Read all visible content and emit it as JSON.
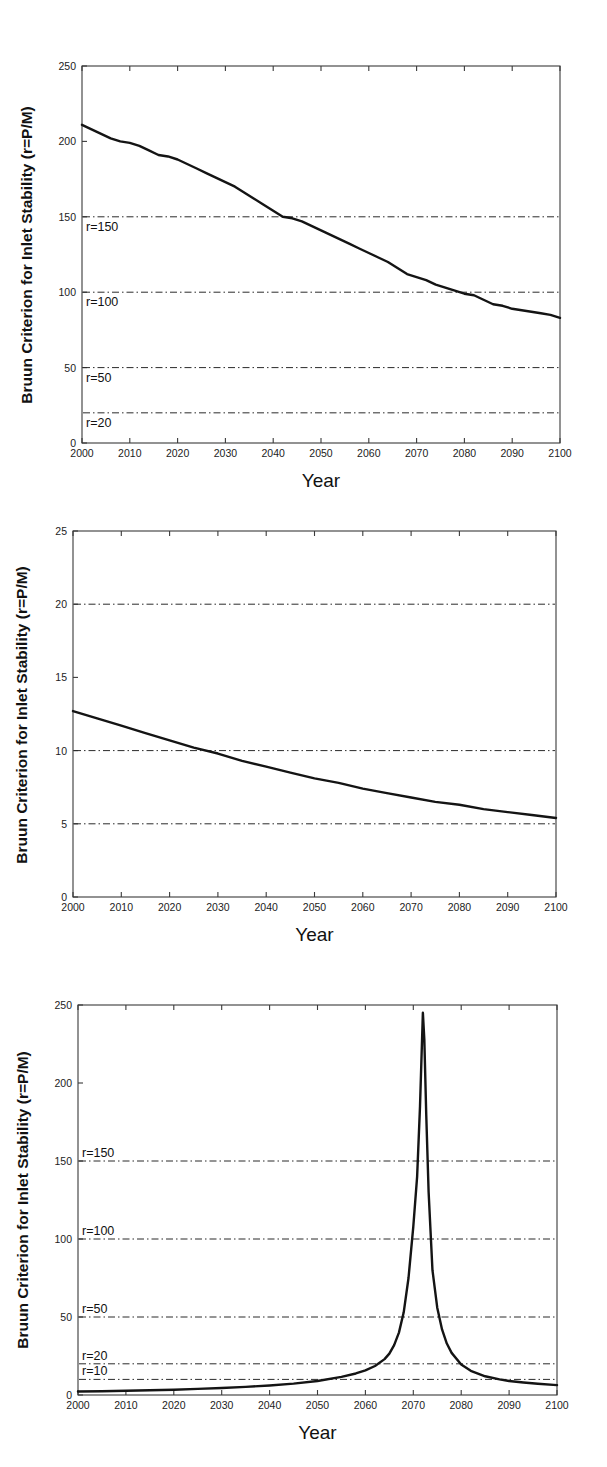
{
  "document": {
    "kind": "three-panel-figure",
    "panel_count": 3
  },
  "shared": {
    "ylabel": "Bruun Criterion for Inlet Stability (r=P/M)",
    "xlabel": "Year",
    "xticks": [
      "2000",
      "2010",
      "2020",
      "2030",
      "2040",
      "2050",
      "2060",
      "2070",
      "2080",
      "2090",
      "2100"
    ]
  },
  "chart_data": [
    {
      "id": "panel-a",
      "type": "line",
      "title": "",
      "xlabel": "Year",
      "ylabel": "Bruun Criterion for Inlet Stability (r=P/M)",
      "xlim": [
        2000,
        2100
      ],
      "ylim": [
        0,
        250
      ],
      "xticks": [
        2000,
        2010,
        2020,
        2030,
        2040,
        2050,
        2060,
        2070,
        2080,
        2090,
        2100
      ],
      "yticks": [
        0,
        50,
        100,
        150,
        200,
        250
      ],
      "xticklabels": [
        "2000",
        "2010",
        "2020",
        "2030",
        "2040",
        "2050",
        "2060",
        "2070",
        "2080",
        "2090",
        "2100"
      ],
      "yticklabels": [
        "0",
        "50",
        "100",
        "150",
        "200",
        "250"
      ],
      "grid": false,
      "legend": "none",
      "reference_lines": [
        {
          "value": 150,
          "label": "r=150",
          "label_side": "below"
        },
        {
          "value": 100,
          "label": "r=100",
          "label_side": "below"
        },
        {
          "value": 50,
          "label": "r=50",
          "label_side": "below"
        },
        {
          "value": 20,
          "label": "r=20",
          "label_side": "below"
        }
      ],
      "x": [
        2000,
        2002,
        2004,
        2006,
        2008,
        2010,
        2012,
        2014,
        2016,
        2018,
        2020,
        2022,
        2024,
        2026,
        2028,
        2030,
        2032,
        2034,
        2036,
        2038,
        2040,
        2042,
        2044,
        2046,
        2048,
        2050,
        2052,
        2054,
        2056,
        2058,
        2060,
        2062,
        2064,
        2066,
        2068,
        2070,
        2072,
        2074,
        2076,
        2078,
        2080,
        2082,
        2084,
        2086,
        2088,
        2090,
        2092,
        2094,
        2096,
        2098,
        2100
      ],
      "series": [
        {
          "name": "r (P/M)",
          "values": [
            211,
            208,
            205,
            202,
            200,
            199,
            197,
            194,
            191,
            190,
            188,
            185,
            182,
            179,
            176,
            173,
            170,
            166,
            162,
            158,
            154,
            150,
            149,
            147,
            144,
            141,
            138,
            135,
            132,
            129,
            126,
            123,
            120,
            116,
            112,
            110,
            108,
            105,
            103,
            101,
            99,
            98,
            95,
            92,
            91,
            89,
            88,
            87,
            86,
            85,
            83
          ]
        }
      ]
    },
    {
      "id": "panel-b",
      "type": "line",
      "title": "",
      "xlabel": "Year",
      "ylabel": "Bruun Criterion for Inlet Stability (r=P/M)",
      "xlim": [
        2000,
        2100
      ],
      "ylim": [
        0,
        25
      ],
      "xticks": [
        2000,
        2010,
        2020,
        2030,
        2040,
        2050,
        2060,
        2070,
        2080,
        2090,
        2100
      ],
      "yticks": [
        0,
        5,
        10,
        15,
        20,
        25
      ],
      "xticklabels": [
        "2000",
        "2010",
        "2020",
        "2030",
        "2040",
        "2050",
        "2060",
        "2070",
        "2080",
        "2090",
        "2100"
      ],
      "yticklabels": [
        "0",
        "5",
        "10",
        "15",
        "20",
        "25"
      ],
      "grid": false,
      "legend": "none",
      "reference_lines": [
        {
          "value": 20,
          "label": "",
          "label_side": "none"
        },
        {
          "value": 10,
          "label": "",
          "label_side": "none"
        },
        {
          "value": 5,
          "label": "",
          "label_side": "none"
        }
      ],
      "x": [
        2000,
        2005,
        2010,
        2015,
        2020,
        2025,
        2030,
        2035,
        2040,
        2045,
        2050,
        2055,
        2060,
        2065,
        2070,
        2075,
        2080,
        2085,
        2090,
        2095,
        2100
      ],
      "series": [
        {
          "name": "r (P/M)",
          "values": [
            12.7,
            12.2,
            11.7,
            11.2,
            10.7,
            10.2,
            9.8,
            9.3,
            8.9,
            8.5,
            8.1,
            7.8,
            7.4,
            7.1,
            6.8,
            6.5,
            6.3,
            6.0,
            5.8,
            5.6,
            5.4
          ]
        }
      ]
    },
    {
      "id": "panel-c",
      "type": "line",
      "title": "",
      "xlabel": "Year",
      "ylabel": "Bruun Criterion for Inlet Stability (r=P/M)",
      "xlim": [
        2000,
        2100
      ],
      "ylim": [
        0,
        250
      ],
      "xticks": [
        2000,
        2010,
        2020,
        2030,
        2040,
        2050,
        2060,
        2070,
        2080,
        2090,
        2100
      ],
      "yticks": [
        0,
        50,
        100,
        150,
        200,
        250
      ],
      "xticklabels": [
        "2000",
        "2010",
        "2020",
        "2030",
        "2040",
        "2050",
        "2060",
        "2070",
        "2080",
        "2090",
        "2100"
      ],
      "yticklabels": [
        "0",
        "50",
        "100",
        "150",
        "200",
        "250"
      ],
      "grid": false,
      "legend": "none",
      "annotation": "Singular peak near 2072 reaching approximately 245",
      "reference_lines": [
        {
          "value": 150,
          "label": "r=150",
          "label_side": "above"
        },
        {
          "value": 100,
          "label": "r=100",
          "label_side": "above"
        },
        {
          "value": 50,
          "label": "r=50",
          "label_side": "above"
        },
        {
          "value": 20,
          "label": "r=20",
          "label_side": "above"
        },
        {
          "value": 10,
          "label": "r=10",
          "label_side": "above"
        }
      ],
      "peak": {
        "x": 2072,
        "y": 245
      },
      "x": [
        2000,
        2005,
        2010,
        2015,
        2020,
        2025,
        2030,
        2035,
        2040,
        2045,
        2050,
        2055,
        2058,
        2060,
        2062,
        2064,
        2065,
        2066,
        2067,
        2068,
        2069,
        2070,
        2070.8,
        2071.4,
        2071.8,
        2072,
        2072.3,
        2072.7,
        2073.2,
        2074,
        2075,
        2076,
        2077,
        2078,
        2080,
        2082,
        2085,
        2088,
        2090,
        2093,
        2096,
        2100
      ],
      "series": [
        {
          "name": "r (P/M)",
          "values": [
            2.2,
            2.4,
            2.7,
            3.0,
            3.4,
            3.9,
            4.5,
            5.2,
            6.1,
            7.3,
            9.0,
            11.6,
            13.8,
            15.8,
            18.6,
            23.0,
            26.5,
            32.0,
            40.0,
            53.0,
            75.0,
            108.0,
            140.0,
            185.0,
            225.0,
            245.0,
            228.0,
            180.0,
            130.0,
            80.0,
            56.0,
            42.0,
            33.0,
            27.0,
            19.5,
            15.5,
            12.0,
            10.0,
            9.0,
            8.0,
            7.2,
            6.3
          ]
        }
      ]
    }
  ]
}
